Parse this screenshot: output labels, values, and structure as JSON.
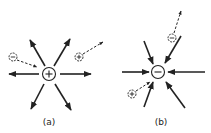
{
  "figure": {
    "panels": [
      {
        "id": "a",
        "label": "(a)",
        "central_charge": {
          "sign": "+",
          "description": "positive charge, field lines point outward"
        },
        "field_direction": "outward",
        "test_charges": [
          {
            "sign": "−",
            "motion": "attracted toward central charge"
          },
          {
            "sign": "+",
            "motion": "repelled away from central charge"
          }
        ]
      },
      {
        "id": "b",
        "label": "(b)",
        "central_charge": {
          "sign": "−",
          "description": "negative charge, field lines point inward"
        },
        "field_direction": "inward",
        "test_charges": [
          {
            "sign": "−",
            "motion": "repelled away from central charge"
          },
          {
            "sign": "+",
            "motion": "attracted toward central charge"
          }
        ]
      }
    ],
    "colors": {
      "ink": "#222222",
      "background": "#ffffff"
    }
  }
}
